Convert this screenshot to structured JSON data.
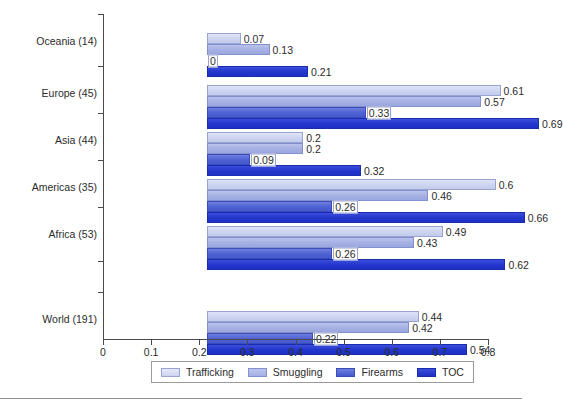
{
  "chart_data": {
    "type": "bar",
    "orientation": "horizontal",
    "title": "",
    "xlabel": "",
    "ylabel": "",
    "xlim": [
      0,
      0.8
    ],
    "xticks": [
      "0",
      "0.1",
      "0.2",
      "0.3",
      "0.4",
      "0.5",
      "0.6",
      "0.7",
      "0.8"
    ],
    "xtick_values": [
      0,
      0.1,
      0.2,
      0.3,
      0.4,
      0.5,
      0.6,
      0.7,
      0.8
    ],
    "grid": false,
    "legend_position": "bottom",
    "categories": [
      "Oceania (14)",
      "Europe (45)",
      "Asia (44)",
      "Americas (35)",
      "Africa (53)",
      "World (191)"
    ],
    "series": [
      {
        "name": "Trafficking",
        "color": "#cdd4f0",
        "values": [
          0.07,
          0.61,
          0.2,
          0.6,
          0.49,
          0.44
        ],
        "labels": [
          "0.07",
          "0.61",
          "0.2",
          "0.6",
          "0.49",
          "0.44"
        ]
      },
      {
        "name": "Smuggling",
        "color": "#a5b0e3",
        "values": [
          0.13,
          0.57,
          0.2,
          0.46,
          0.43,
          0.42
        ],
        "labels": [
          "0.13",
          "0.57",
          "0.2",
          "0.46",
          "0.43",
          "0.42"
        ]
      },
      {
        "name": "Firearms",
        "color": "#4558cd",
        "values": [
          0,
          0.33,
          0.09,
          0.26,
          0.26,
          0.22
        ],
        "labels": [
          "0",
          "0.33",
          "0.09",
          "0.26",
          "0.26",
          "0.22"
        ]
      },
      {
        "name": "TOC",
        "color": "#1e31c4",
        "values": [
          0.21,
          0.69,
          0.32,
          0.66,
          0.62,
          0.54
        ],
        "labels": [
          "0.21",
          "0.69",
          "0.32",
          "0.66",
          "0.62",
          "0.54"
        ]
      }
    ]
  }
}
